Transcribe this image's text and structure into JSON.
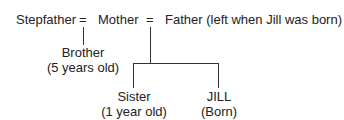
{
  "diagram": {
    "top_row": {
      "stepfather": "Stepfather",
      "eq1": "=",
      "mother": "Mother",
      "eq2": "=",
      "father": "Father (left when Jill was born)"
    },
    "brother": {
      "name": "Brother",
      "note": "(5 years old)"
    },
    "sister": {
      "name": "Sister",
      "note": "(1 year old)"
    },
    "jill": {
      "name": "JILL",
      "note": "(Born)"
    },
    "line_color": "#333333"
  }
}
